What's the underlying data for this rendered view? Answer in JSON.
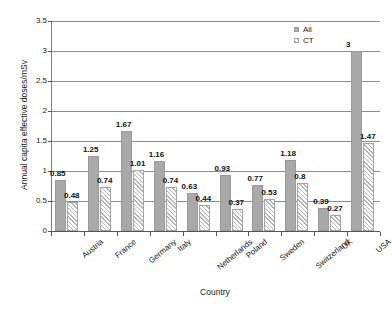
{
  "chart_data": {
    "type": "bar",
    "title": "",
    "xlabel": "Country",
    "ylabel": "Annual capita effective doses/mSv",
    "ylim": [
      0,
      3.5
    ],
    "yticks": [
      "0",
      "0.5",
      "1",
      "1.5",
      "2",
      "2.5",
      "3",
      "3.5"
    ],
    "grid": true,
    "legend_position": "top-right-inside",
    "categories": [
      "Austria",
      "France",
      "Germany",
      "Italy",
      "Netherlands",
      "Poland",
      "Sweden",
      "Switzerland",
      "UK",
      "USA"
    ],
    "series": [
      {
        "name": "All",
        "values": [
          0.85,
          1.25,
          1.67,
          1.16,
          0.63,
          0.93,
          0.77,
          1.18,
          0.39,
          3
        ],
        "labels": [
          "0.85",
          "1.25",
          "1.67",
          "1.16",
          "0.63",
          "0.93",
          "0.77",
          "1.18",
          "0.39",
          "3"
        ],
        "color": "#a9a9a9",
        "fill": "solid"
      },
      {
        "name": "CT",
        "values": [
          0.48,
          0.74,
          1.01,
          0.74,
          0.44,
          0.37,
          0.53,
          0.8,
          0.27,
          1.47
        ],
        "labels": [
          "0.48",
          "0.74",
          "1.01",
          "0.74",
          "0.44",
          "0.37",
          "0.53",
          "0.8",
          "0.27",
          "1.47"
        ],
        "color": "#b4b4b4",
        "fill": "diagonal-hatch"
      }
    ]
  },
  "legend": {
    "entries": [
      {
        "label": "All"
      },
      {
        "label": "CT"
      }
    ]
  }
}
